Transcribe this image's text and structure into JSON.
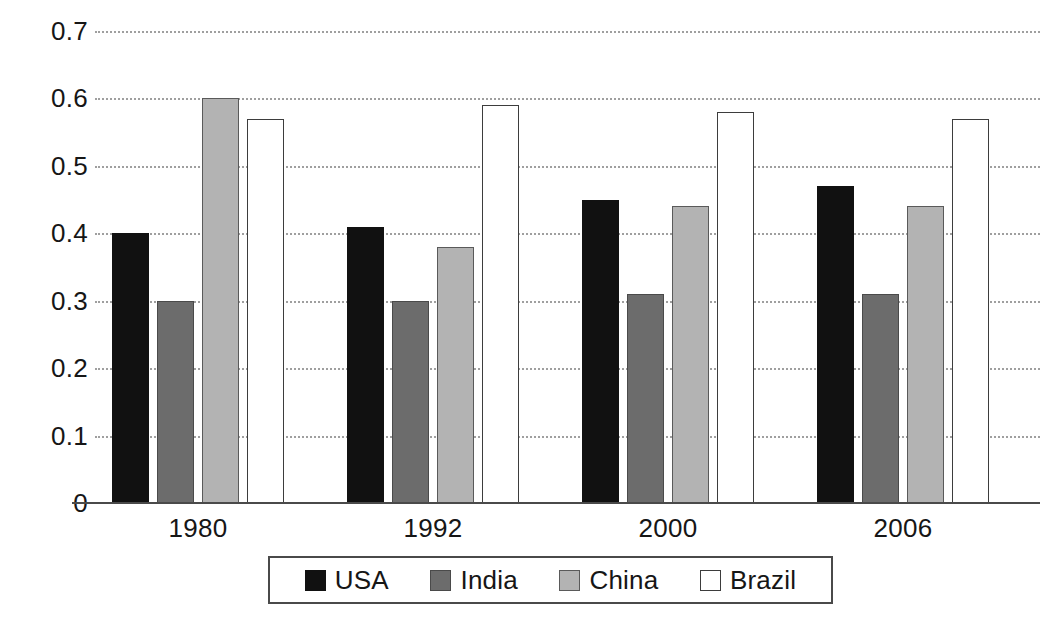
{
  "chart_data": {
    "type": "bar",
    "title": "",
    "subtitle": "",
    "xlabel": "",
    "ylabel": "",
    "categories": [
      "1980",
      "1992",
      "2000",
      "2006"
    ],
    "series": [
      {
        "name": "USA",
        "color": "#111111",
        "values": [
          0.4,
          0.41,
          0.45,
          0.47
        ]
      },
      {
        "name": "India",
        "color": "#6c6c6c",
        "values": [
          0.3,
          0.3,
          0.31,
          0.31
        ]
      },
      {
        "name": "China",
        "color": "#b3b3b3",
        "values": [
          0.6,
          0.38,
          0.44,
          0.44
        ]
      },
      {
        "name": "Brazil",
        "color": "#ffffff",
        "values": [
          0.57,
          0.59,
          0.58,
          0.57
        ]
      }
    ],
    "ylim": [
      0,
      0.7
    ],
    "ytick_labels": [
      "0",
      "0.1",
      "0.2",
      "0.3",
      "0.4",
      "0.5",
      "0.6",
      "0.7"
    ],
    "ytick_values": [
      0,
      0.1,
      0.2,
      0.3,
      0.4,
      0.5,
      0.6,
      0.7
    ],
    "grid": true,
    "grid_style": "dotted-horizontal",
    "legend_position": "bottom",
    "legend_entries": [
      "USA",
      "India",
      "China",
      "Brazil"
    ]
  }
}
